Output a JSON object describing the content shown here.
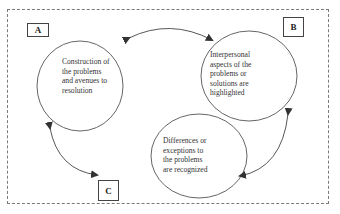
{
  "diagram": {
    "boxes": [
      {
        "id": "A",
        "label": "A"
      },
      {
        "id": "B",
        "label": "B"
      },
      {
        "id": "C",
        "label": "C"
      }
    ],
    "nodes": [
      {
        "id": "A",
        "lines": [
          "Construction of",
          "the problems",
          "and avenues to",
          "resolution"
        ]
      },
      {
        "id": "B",
        "lines": [
          "Interpersonal",
          "aspects of the",
          "problems or",
          "solutions are",
          "highlighted"
        ]
      },
      {
        "id": "C",
        "lines": [
          "Differences or",
          "exceptions to",
          "the problems",
          "are recognized"
        ]
      }
    ],
    "edges": [
      {
        "from": "A",
        "to": "B",
        "type": "bidirectional"
      },
      {
        "from": "B",
        "to": "C",
        "type": "bidirectional"
      },
      {
        "from": "C",
        "to": "A",
        "type": "bidirectional"
      }
    ],
    "colors": {
      "stroke": "#444444",
      "border": "#7a7a7a",
      "text": "#333333"
    }
  }
}
